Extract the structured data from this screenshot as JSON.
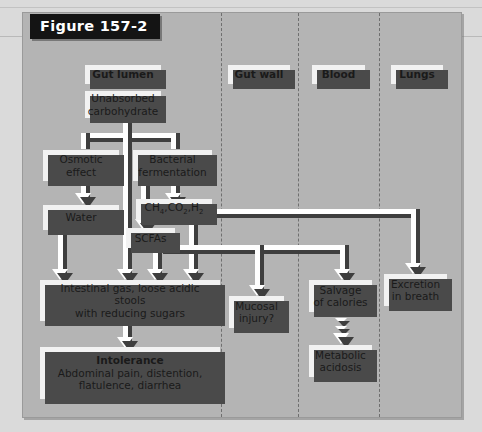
{
  "figure": {
    "title": "Figure 157-2"
  },
  "columns": [
    {
      "id": "gut-lumen",
      "label": "Gut lumen"
    },
    {
      "id": "gut-wall",
      "label": "Gut wall"
    },
    {
      "id": "blood",
      "label": "Blood"
    },
    {
      "id": "lungs",
      "label": "Lungs"
    }
  ],
  "nodes": {
    "unabsorbed_carbohydrate": "Unabsorbed\ncarbohydrate",
    "unabsorbed_line1": "Unabsorbed",
    "unabsorbed_line2": "carbohydrate",
    "osmotic_line1": "Osmotic",
    "osmotic_line2": "effect",
    "bacterial_line1": "Bacterial",
    "bacterial_line2": "fermentation",
    "water": "Water",
    "gases_ch4": "CH",
    "gases_ch4_sub": "4",
    "gases_co2": ",CO",
    "gases_co2_sub": "2",
    "gases_h2": ",H",
    "gases_h2_sub": "2",
    "scfas": "SCFAs",
    "intestinal_line1": "Intestinal gas, loose acidic stools",
    "intestinal_line2": "with reducing sugars",
    "intolerance_title": "Intolerance",
    "intolerance_line1": "Abdominal pain, distention,",
    "intolerance_line2": "flatulence, diarrhea",
    "mucosal_line1": "Mucosal",
    "mucosal_line2": "injury?",
    "salvage_line1": "Salvage",
    "salvage_line2": "of calories",
    "metabolic_line1": "Metabolic",
    "metabolic_line2": "acidosis",
    "excretion_line1": "Excretion",
    "excretion_line2": "in breath"
  },
  "colors": {
    "page_background": "#dadada",
    "panel_background": "#b4b4b4",
    "box_fill": "#f2f2f2",
    "shadow": "#4a4a4a",
    "connector_fill": "#ffffff",
    "connector_shadow": "#3e3e3e",
    "title_background": "#141414",
    "title_text": "#ffffff",
    "divider": "#6f6f6f"
  }
}
